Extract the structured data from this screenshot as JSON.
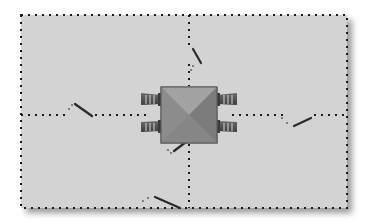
{
  "diagram": {
    "type": "switch-wiring-schematic",
    "canvas": {
      "width": 372,
      "height": 224,
      "background": "#ffffff"
    },
    "panel": {
      "x": 21,
      "y": 15,
      "width": 326,
      "height": 193,
      "fill": "#d3d3d3",
      "border_style": "dotted",
      "border_color": "#1a1a1a",
      "shadow_color": "#9a9a9a"
    },
    "component": {
      "name": "central-component",
      "shape": "square-pyramid",
      "x": 161,
      "y": 87,
      "width": 56,
      "height": 56,
      "colors": {
        "top": "#9c9c9c",
        "left": "#8a8a8a",
        "right": "#7e7e7e",
        "bottom": "#888888",
        "edge": "#5a5a5a"
      },
      "connectors": [
        {
          "name": "connector-left-upper",
          "side": "left",
          "y": 99
        },
        {
          "name": "connector-left-lower",
          "side": "left",
          "y": 126
        },
        {
          "name": "connector-right-upper",
          "side": "right",
          "y": 99
        },
        {
          "name": "connector-right-lower",
          "side": "right",
          "y": 126
        }
      ],
      "connector_color": "#555555"
    },
    "lines": [
      {
        "name": "line-top",
        "from": [
          189,
          87
        ],
        "to": [
          189,
          15
        ],
        "break": {
          "x1": 193,
          "y1": 49,
          "x2": 201,
          "y2": 63
        }
      },
      {
        "name": "line-bottom",
        "from": [
          189,
          143
        ],
        "to": [
          189,
          208
        ],
        "break": {
          "x1": 155,
          "y1": 197,
          "x2": 180,
          "y2": 208
        }
      },
      {
        "name": "line-left",
        "from": [
          146,
          115
        ],
        "to": [
          21,
          115
        ],
        "break": {
          "x1": 75,
          "y1": 104,
          "x2": 92,
          "y2": 116
        }
      },
      {
        "name": "line-right",
        "from": [
          232,
          115
        ],
        "to": [
          347,
          115
        ],
        "break": {
          "x1": 294,
          "y1": 126,
          "x2": 311,
          "y2": 118
        }
      }
    ],
    "short_break_near_component": {
      "x1": 174,
      "y1": 151,
      "x2": 186,
      "y2": 142
    },
    "dot_color": "#1a1a1a",
    "break_color": "#2a2a2a"
  }
}
